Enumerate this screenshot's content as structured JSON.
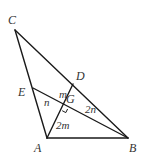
{
  "diagram": {
    "type": "geometry-triangle",
    "points": {
      "A": {
        "label": "A",
        "x": 47,
        "y": 138,
        "lx": 34,
        "ly": 152
      },
      "B": {
        "label": "B",
        "x": 128,
        "y": 138,
        "lx": 129,
        "ly": 152
      },
      "C": {
        "label": "C",
        "x": 15,
        "y": 30,
        "lx": 8,
        "ly": 24
      },
      "D": {
        "label": "D",
        "x": 73,
        "y": 84,
        "lx": 76,
        "ly": 80
      },
      "E": {
        "label": "E",
        "x": 33,
        "y": 88,
        "lx": 18,
        "ly": 96
      },
      "G": {
        "label": "G",
        "x": 64,
        "y": 107,
        "lx": 66,
        "ly": 103
      }
    },
    "segments": [
      [
        "A",
        "B"
      ],
      [
        "B",
        "C"
      ],
      [
        "C",
        "A"
      ],
      [
        "A",
        "D"
      ],
      [
        "B",
        "E"
      ]
    ],
    "segment_labels": [
      {
        "text": "m",
        "x": 59,
        "y": 98,
        "meaning": "DG"
      },
      {
        "text": "n",
        "x": 44,
        "y": 106,
        "meaning": "EG"
      },
      {
        "text": "2n",
        "x": 85,
        "y": 113,
        "meaning": "GB"
      },
      {
        "text": "2m",
        "x": 56,
        "y": 129,
        "meaning": "AG"
      }
    ],
    "right_angle_at": "G",
    "colors": {
      "stroke": "#1a1a1a",
      "label": "#333333"
    }
  }
}
